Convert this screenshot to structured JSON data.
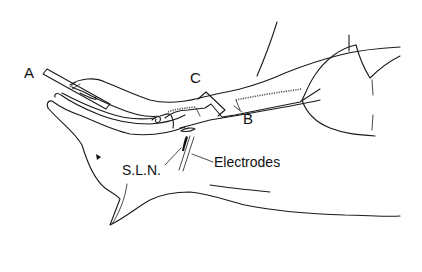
{
  "figure": {
    "labels": {
      "a": "A",
      "b": "B",
      "c": "C",
      "sln": "S.L.N.",
      "electrodes": "Electrodes"
    },
    "colors": {
      "background": "#ffffff",
      "line": "#1a1a1a"
    }
  }
}
